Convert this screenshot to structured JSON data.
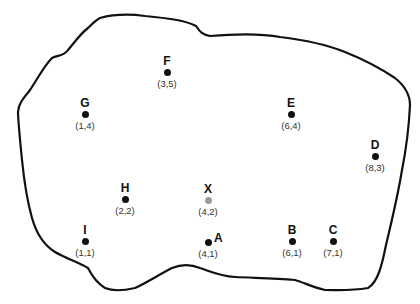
{
  "map": {
    "outline_color": "#111111",
    "dot_color": "#111111",
    "highlight_dot_color": "#9a9a9a",
    "points": [
      {
        "label": "F",
        "coord": "(3,5)"
      },
      {
        "label": "G",
        "coord": "(1,4)"
      },
      {
        "label": "E",
        "coord": "(6,4)"
      },
      {
        "label": "D",
        "coord": "(8,3)"
      },
      {
        "label": "H",
        "coord": "(2,2)"
      },
      {
        "label": "X",
        "coord": "(4,2)"
      },
      {
        "label": "I",
        "coord": "(1,1)"
      },
      {
        "label": "A",
        "coord": "(4,1)"
      },
      {
        "label": "B",
        "coord": "(6,1)"
      },
      {
        "label": "C",
        "coord": "(7,1)"
      }
    ]
  }
}
